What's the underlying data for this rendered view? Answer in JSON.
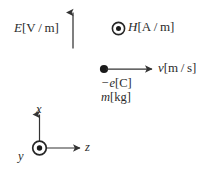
{
  "figure": {
    "background_color": "#ffffff",
    "line_color": "#333333",
    "text_color": "#2b2b2b"
  },
  "fields": {
    "electric": {
      "symbol": "E",
      "unit": "[V / m]",
      "direction": "up",
      "arrow_name": "electric-field-arrow"
    },
    "magnetic": {
      "symbol": "H",
      "unit": "[A / m]",
      "direction": "out-of-page",
      "marker": "circle-dot"
    }
  },
  "particle": {
    "velocity": {
      "symbol": "v",
      "unit": "[m / s]",
      "direction": "right"
    },
    "charge": {
      "symbol": "−e",
      "unit": "[C]"
    },
    "mass": {
      "symbol": "m",
      "unit": "[kg]"
    }
  },
  "axes": {
    "x": {
      "label": "x",
      "direction": "up"
    },
    "y": {
      "label": "y",
      "direction": "out-of-page",
      "marker": "circle-dot"
    },
    "z": {
      "label": "z",
      "direction": "right"
    }
  }
}
